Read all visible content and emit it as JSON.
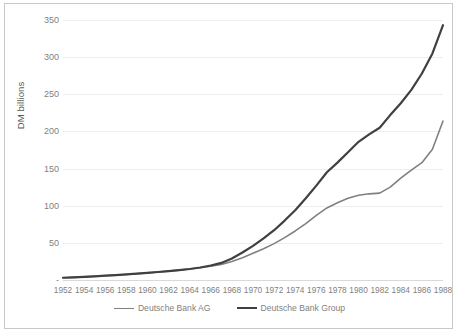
{
  "chart_data": {
    "type": "line",
    "title": "",
    "xlabel": "",
    "ylabel": "DM billions",
    "ylim": [
      0,
      350
    ],
    "xlim": [
      1952,
      1988
    ],
    "grid": true,
    "legend_position": "bottom",
    "y_ticks": [
      "-",
      "50",
      "100",
      "150",
      "200",
      "250",
      "300",
      "350"
    ],
    "y_tick_values": [
      0,
      50,
      100,
      150,
      200,
      250,
      300,
      350
    ],
    "x_tick_labels": [
      "1952",
      "1954",
      "1956",
      "1958",
      "1960",
      "1962",
      "1964",
      "1966",
      "1968",
      "1970",
      "1972",
      "1974",
      "1976",
      "1978",
      "1980",
      "1982",
      "1984",
      "1986",
      "1988"
    ],
    "x": [
      1952,
      1953,
      1954,
      1955,
      1956,
      1957,
      1958,
      1959,
      1960,
      1961,
      1962,
      1963,
      1964,
      1965,
      1966,
      1967,
      1968,
      1969,
      1970,
      1971,
      1972,
      1973,
      1974,
      1975,
      1976,
      1977,
      1978,
      1979,
      1980,
      1981,
      1982,
      1983,
      1984,
      1985,
      1986,
      1987,
      1988
    ],
    "series": [
      {
        "name": "Deutsche Bank AG",
        "color": "#808080",
        "width": 1.6,
        "values": [
          3,
          3.5,
          4.2,
          5,
          5.8,
          6.6,
          7.5,
          8.5,
          9.6,
          10.8,
          12,
          13.3,
          14.8,
          16.5,
          18.5,
          21,
          25,
          30,
          36,
          42,
          49,
          57,
          66,
          76,
          87,
          97,
          104,
          110,
          114,
          116,
          117,
          125,
          137,
          148,
          158,
          176,
          214
        ]
      },
      {
        "name": "Deutsche Bank Group",
        "color": "#404040",
        "width": 2.2,
        "values": [
          3,
          3.5,
          4.2,
          5,
          5.8,
          6.6,
          7.5,
          8.5,
          9.6,
          10.8,
          12,
          13.3,
          14.8,
          16.8,
          19.5,
          23,
          29,
          37,
          46,
          56,
          67,
          80,
          94,
          110,
          127,
          145,
          158,
          172,
          186,
          196,
          205,
          222,
          238,
          256,
          278,
          305,
          343
        ]
      }
    ]
  }
}
